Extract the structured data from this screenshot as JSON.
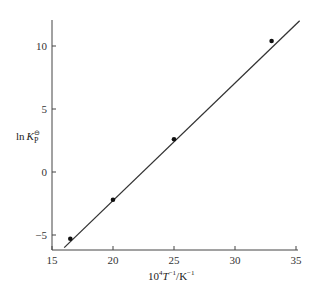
{
  "chart_data": {
    "type": "scatter",
    "title": "",
    "xlabel": "10^4 T^-1/K^-1",
    "ylabel": "ln K°P",
    "xlim": [
      15,
      35
    ],
    "ylim": [
      -6,
      12
    ],
    "xticks": [
      15,
      20,
      25,
      30,
      35
    ],
    "yticks": [
      -5,
      0,
      5,
      10
    ],
    "grid": false,
    "legend": null,
    "series": [
      {
        "name": "data points",
        "type": "scatter",
        "x": [
          16.5,
          20,
          25,
          33
        ],
        "y": [
          -5.3,
          -2.2,
          2.6,
          10.4
        ]
      },
      {
        "name": "linear fit",
        "type": "line",
        "x": [
          16.0,
          35.3
        ],
        "y": [
          -6.0,
          12.0
        ]
      }
    ]
  },
  "labels": {
    "xlabel_main": "10",
    "xlabel_sup1": "4",
    "xlabel_T": "T",
    "xlabel_sup2": "−1",
    "xlabel_unit": "/K",
    "xlabel_sup3": "−1",
    "ylabel_ln": "ln",
    "ylabel_K": "K",
    "ylabel_sup": "⊖",
    "ylabel_sub": "P"
  },
  "tick_text": {
    "x": [
      "15",
      "20",
      "25",
      "30",
      "35"
    ],
    "y": [
      "−5",
      "0",
      "5",
      "10"
    ]
  }
}
